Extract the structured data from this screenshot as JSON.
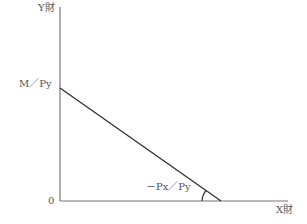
{
  "diagram": {
    "type": "budget-line",
    "y_axis_label": "Y財",
    "x_axis_label": "X財",
    "origin_label": "0",
    "y_intercept_label": "M／Py",
    "slope_label": "－Px／Py",
    "colors": {
      "axis": "#777777",
      "line": "#333333",
      "text": "#555555"
    }
  }
}
